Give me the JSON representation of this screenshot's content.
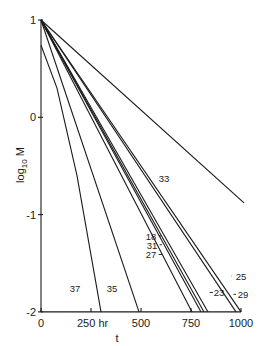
{
  "chart_data": {
    "type": "line",
    "title": "",
    "xlabel": "t",
    "xunit": "hr",
    "ylabel": "log10 M",
    "xlim": [
      0,
      1000
    ],
    "ylim": [
      -2,
      1
    ],
    "grid": false,
    "legend": "inline labels",
    "x_ticks": [
      0,
      250,
      500,
      750,
      1000
    ],
    "x_tick_labels": [
      "0",
      "250 hr",
      "500",
      "750",
      "1000"
    ],
    "y_ticks": [
      1,
      0,
      -1,
      -2
    ],
    "y_tick_labels": [
      "1",
      "0",
      "-1",
      "-2"
    ],
    "series": [
      {
        "name": "37",
        "points": [
          [
            0,
            0.74
          ],
          [
            80,
            0.3
          ],
          [
            180,
            -0.6
          ],
          [
            300,
            -2
          ]
        ]
      },
      {
        "name": "35",
        "points": [
          [
            0,
            1
          ],
          [
            490,
            -2
          ]
        ]
      },
      {
        "name": "27",
        "points": [
          [
            0,
            1
          ],
          [
            755,
            -2
          ]
        ]
      },
      {
        "name": "31",
        "points": [
          [
            0,
            1
          ],
          [
            800,
            -2
          ]
        ]
      },
      {
        "name": "18",
        "points": [
          [
            0,
            1
          ],
          [
            815,
            -2
          ]
        ]
      },
      {
        "name": "23",
        "points": [
          [
            0,
            1
          ],
          [
            835,
            -2
          ]
        ]
      },
      {
        "name": "25",
        "points": [
          [
            0,
            1
          ],
          [
            975,
            -2
          ]
        ]
      },
      {
        "name": "29",
        "points": [
          [
            0,
            1
          ],
          [
            1000,
            -2
          ]
        ]
      },
      {
        "name": "33",
        "points": [
          [
            0,
            1
          ],
          [
            1015,
            -0.88
          ]
        ]
      }
    ],
    "annotations": [
      {
        "text": "37",
        "x": 170,
        "y": -1.75
      },
      {
        "text": "35",
        "x": 355,
        "y": -1.75
      },
      {
        "text": "33",
        "x": 615,
        "y": -0.62
      },
      {
        "text": "18",
        "x": 550,
        "y": -1.22
      },
      {
        "text": "31",
        "x": 555,
        "y": -1.31
      },
      {
        "text": "27",
        "x": 550,
        "y": -1.41
      },
      {
        "text": "25",
        "x": 1000,
        "y": -1.63
      },
      {
        "text": "23",
        "x": 890,
        "y": -1.8
      },
      {
        "text": "29",
        "x": 1010,
        "y": -1.82
      }
    ]
  }
}
